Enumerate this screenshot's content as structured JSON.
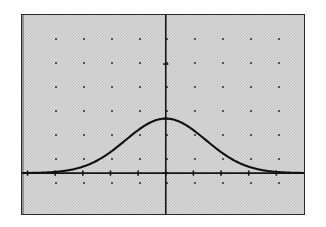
{
  "window": {
    "title": "Graph Window",
    "background_color": "#d9d9d9",
    "border_color": "#2b2b2b"
  },
  "chart_data": {
    "type": "line",
    "subtitle": "",
    "xlabel": "",
    "ylabel": "",
    "grid": "dots",
    "grid_visible": true,
    "legend_position": "none",
    "axes": {
      "x_axis_visible": true,
      "y_axis_visible": true,
      "x_axis_y_value": 0,
      "y_axis_x_value": 0,
      "tick_marks": true,
      "tick_labels_visible": false
    },
    "xlim": [
      -5.2,
      5.0
    ],
    "ylim": [
      -0.75,
      2.9
    ],
    "x_tick_step": 1,
    "y_tick_step": 1,
    "x_ticks": [
      -5,
      -4,
      -3,
      -2,
      -1,
      0,
      1,
      2,
      3,
      4
    ],
    "y_ticks": [
      -0.75,
      0,
      1,
      2,
      2.9
    ],
    "series": [
      {
        "name": "bell curve",
        "function": "y = exp(-x^2 / 4.2)",
        "peak_x": 0,
        "peak_y": 1,
        "x": [
          -5.2,
          -4.8,
          -4.4,
          -4.0,
          -3.6,
          -3.2,
          -2.8,
          -2.4,
          -2.0,
          -1.6,
          -1.2,
          -0.8,
          -0.4,
          0.0,
          0.4,
          0.8,
          1.2,
          1.6,
          2.0,
          2.4,
          2.8,
          3.2,
          3.6,
          4.0,
          4.4,
          4.8,
          5.0
        ],
        "y": [
          0.002,
          0.004,
          0.01,
          0.022,
          0.046,
          0.088,
          0.154,
          0.253,
          0.385,
          0.542,
          0.711,
          0.86,
          0.963,
          1.0,
          0.963,
          0.86,
          0.711,
          0.542,
          0.385,
          0.253,
          0.154,
          0.088,
          0.046,
          0.022,
          0.01,
          0.004,
          0.003
        ]
      }
    ]
  },
  "grid_dots": {
    "x_positions": [
      55,
      83,
      111,
      139,
      166,
      194,
      222,
      250,
      278
    ],
    "y_positions": [
      38,
      62,
      86,
      110,
      134,
      158,
      182
    ]
  }
}
